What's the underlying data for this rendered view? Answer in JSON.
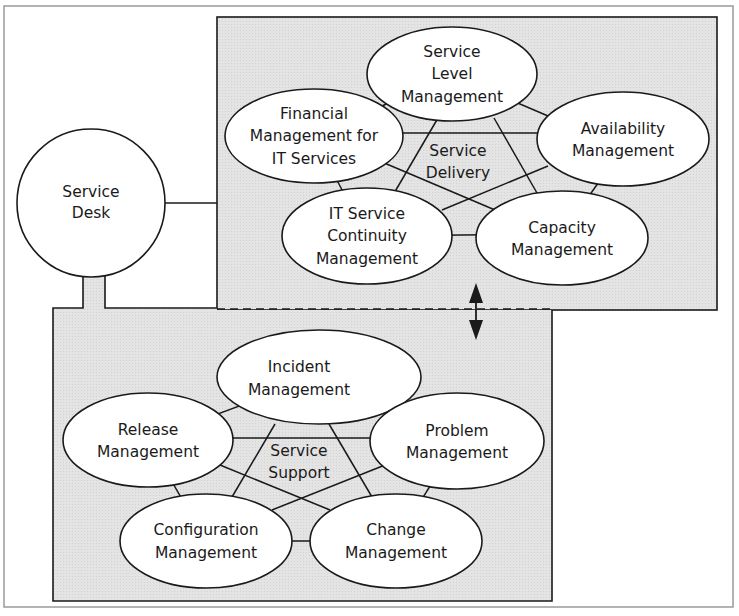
{
  "diagram": {
    "hub": {
      "id": "service-desk",
      "lines": [
        "Service",
        "Desk"
      ]
    },
    "groups": [
      {
        "id": "service-delivery",
        "center_label": [
          "Service",
          "Delivery"
        ],
        "nodes": [
          {
            "id": "service-level-management",
            "lines": [
              "Service",
              "Level",
              "Management"
            ]
          },
          {
            "id": "financial-management",
            "lines": [
              "Financial",
              "Management for",
              "IT Services"
            ]
          },
          {
            "id": "availability-management",
            "lines": [
              "Availability",
              "Management"
            ]
          },
          {
            "id": "it-service-continuity-management",
            "lines": [
              "IT Service",
              "Continuity",
              "Management"
            ]
          },
          {
            "id": "capacity-management",
            "lines": [
              "Capacity",
              "Management"
            ]
          }
        ]
      },
      {
        "id": "service-support",
        "center_label": [
          "Service",
          "Support"
        ],
        "nodes": [
          {
            "id": "incident-management",
            "lines": [
              "Incident",
              "Management"
            ]
          },
          {
            "id": "release-management",
            "lines": [
              "Release",
              "Management"
            ]
          },
          {
            "id": "problem-management",
            "lines": [
              "Problem",
              "Management"
            ]
          },
          {
            "id": "configuration-management",
            "lines": [
              "Configuration",
              "Management"
            ]
          },
          {
            "id": "change-management",
            "lines": [
              "Change",
              "Management"
            ]
          }
        ]
      }
    ],
    "colors": {
      "box_fill": "#e3e3e3",
      "stroke": "#1a1a1a",
      "frame": "#9a9a9a",
      "node_fill": "#ffffff"
    }
  }
}
